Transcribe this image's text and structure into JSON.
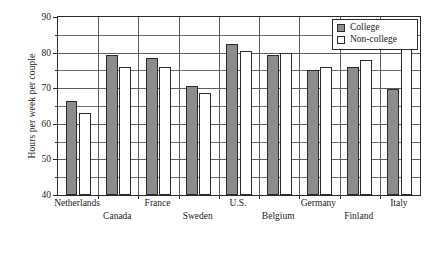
{
  "chart_data": {
    "type": "bar",
    "title": "",
    "xlabel": "",
    "ylabel": "Hours per week per couple",
    "ylim": [
      40,
      90
    ],
    "ytick_labels": [
      "40",
      "50",
      "60",
      "70",
      "80",
      "90"
    ],
    "ytick_values": [
      40,
      50,
      60,
      70,
      80,
      90
    ],
    "minor_tick_values": [
      45,
      55,
      65,
      75,
      85
    ],
    "grid": "horizontal-and-vertical",
    "legend_position": "top-right",
    "categories": [
      "Netherlands",
      "Canada",
      "France",
      "Sweden",
      "U.S.",
      "Belgium",
      "Germany",
      "Finland",
      "Italy"
    ],
    "series": [
      {
        "name": "College",
        "color": "#8c8c8c",
        "values": [
          66.5,
          79.3,
          78.6,
          70.7,
          82.5,
          79.3,
          75.0,
          76.0,
          69.7
        ]
      },
      {
        "name": "Non-college",
        "color": "#ffffff",
        "values": [
          63.0,
          76.0,
          76.0,
          68.7,
          80.5,
          80.0,
          76.0,
          77.8,
          81.0
        ]
      }
    ]
  },
  "legend": {
    "items": [
      {
        "label": "College",
        "swatch": "college"
      },
      {
        "label": "Non-college",
        "swatch": "noncollege"
      }
    ]
  }
}
